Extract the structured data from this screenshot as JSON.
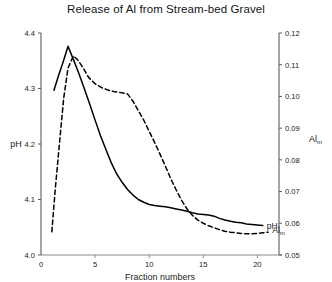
{
  "chart_data": {
    "type": "line",
    "title": "Release of Al from Stream-bed Gravel",
    "xlabel": "Fraction numbers",
    "ylabel": "pH",
    "y2label": "Al",
    "y2label_sub": "m",
    "xlim": [
      0,
      22
    ],
    "ylim": [
      4.0,
      4.4
    ],
    "y2lim": [
      0.05,
      0.12
    ],
    "grid": false,
    "legend_position": "right-inline",
    "xticks": [
      5,
      10,
      15,
      20
    ],
    "xtick_labels": [
      "5",
      "10",
      "15",
      "20"
    ],
    "x_origin_label": "0",
    "yticks": [
      4.0,
      4.1,
      4.2,
      4.3,
      4.4
    ],
    "ytick_labels": [
      "4.0",
      "4.1",
      "4.2",
      "4.3",
      "4.4"
    ],
    "y2ticks": [
      0.05,
      0.06,
      0.07,
      0.08,
      0.09,
      0.1,
      0.11,
      0.12
    ],
    "y2tick_labels": [
      "0.05",
      "0.06",
      "0.07",
      "0.08",
      "0.09",
      "0.10",
      "0.11",
      "0.12"
    ],
    "series": [
      {
        "name": "pH",
        "label": "pH",
        "axis": "left",
        "style": "solid",
        "color": "#000000",
        "x": [
          1.2,
          1.6,
          2.0,
          2.5,
          3.0,
          3.5,
          4.0,
          4.5,
          5.0,
          5.5,
          6.0,
          6.5,
          7.0,
          7.5,
          8.0,
          8.5,
          9.0,
          9.5,
          10.0,
          10.5,
          11.0,
          11.5,
          12.0,
          12.5,
          13.0,
          13.5,
          14.0,
          14.5,
          15.0,
          15.5,
          16.0,
          16.5,
          17.0,
          17.5,
          18.0,
          18.5,
          19.0,
          19.5,
          20.0,
          20.5
        ],
        "y": [
          4.297,
          4.322,
          4.345,
          4.376,
          4.352,
          4.327,
          4.3,
          4.272,
          4.243,
          4.215,
          4.19,
          4.166,
          4.146,
          4.131,
          4.118,
          4.108,
          4.1,
          4.095,
          4.091,
          4.089,
          4.088,
          4.087,
          4.085,
          4.083,
          4.081,
          4.079,
          4.076,
          4.074,
          4.073,
          4.072,
          4.07,
          4.066,
          4.063,
          4.061,
          4.059,
          4.058,
          4.056,
          4.055,
          4.054,
          4.053
        ]
      },
      {
        "name": "Al_m",
        "label": "Al",
        "label_sub": "m",
        "axis": "right",
        "style": "dashed",
        "color": "#000000",
        "x": [
          1.0,
          1.3,
          1.7,
          2.1,
          2.5,
          3.0,
          3.4,
          3.9,
          4.4,
          5.0,
          5.6,
          6.2,
          6.8,
          7.4,
          8.0,
          8.5,
          9.0,
          9.5,
          10.0,
          10.5,
          11.0,
          11.5,
          12.0,
          12.5,
          13.0,
          13.5,
          14.0,
          14.5,
          15.0,
          15.5,
          16.0,
          16.5,
          17.0,
          17.5,
          18.0,
          18.5,
          19.0,
          19.5,
          20.0,
          20.5,
          21.0
        ],
        "y": [
          0.0573,
          0.07,
          0.085,
          0.0995,
          0.109,
          0.1128,
          0.1115,
          0.109,
          0.106,
          0.104,
          0.1028,
          0.102,
          0.1015,
          0.1012,
          0.1008,
          0.0985,
          0.0955,
          0.0925,
          0.089,
          0.0855,
          0.0818,
          0.078,
          0.074,
          0.0705,
          0.0672,
          0.0645,
          0.0625,
          0.061,
          0.06,
          0.0592,
          0.0586,
          0.058,
          0.0575,
          0.0572,
          0.057,
          0.0568,
          0.0567,
          0.0567,
          0.0568,
          0.057,
          0.0572
        ]
      }
    ]
  }
}
